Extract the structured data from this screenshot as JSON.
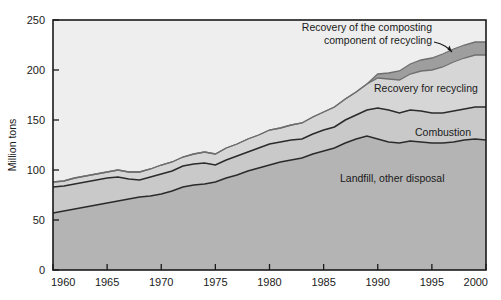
{
  "chart_data": {
    "type": "area",
    "title": "",
    "xlabel": "",
    "ylabel": "Million tons",
    "xlim": [
      1960,
      2000
    ],
    "ylim": [
      0,
      250
    ],
    "ytick_step": 50,
    "xtick_step": 5,
    "grid": false,
    "legend_position": "inline-annotations",
    "stacked": true,
    "x": [
      1960,
      1961,
      1962,
      1963,
      1964,
      1965,
      1966,
      1967,
      1968,
      1969,
      1970,
      1971,
      1972,
      1973,
      1974,
      1975,
      1976,
      1977,
      1978,
      1979,
      1980,
      1981,
      1982,
      1983,
      1984,
      1985,
      1986,
      1987,
      1988,
      1989,
      1990,
      1991,
      1992,
      1993,
      1994,
      1995,
      1996,
      1997,
      1998,
      1999,
      2000
    ],
    "xticklabels": [
      "1960",
      "1965",
      "1970",
      "1975",
      "1980",
      "1985",
      "1990",
      "1995",
      "2000"
    ],
    "yticklabels": [
      "0",
      "50",
      "100",
      "150",
      "200",
      "250"
    ],
    "series": [
      {
        "name": "Landfill, other disposal",
        "label_text": "Landfill, other disposal",
        "fill_color": "#b4b4b4",
        "line_color": "#2b2b2b",
        "values": [
          57,
          59,
          61,
          63,
          65,
          67,
          69,
          71,
          73,
          74,
          76,
          79,
          83,
          85,
          86,
          88,
          92,
          95,
          99,
          102,
          105,
          108,
          110,
          112,
          116,
          119,
          122,
          127,
          131,
          134,
          131,
          128,
          127,
          129,
          128,
          127,
          127,
          128,
          130,
          131,
          130
        ]
      },
      {
        "name": "Combustion",
        "label_text": "Combustion",
        "fill_color": "#c9c9c9",
        "line_color": "#2b2b2b",
        "cumulative_values": [
          83,
          84,
          86,
          88,
          90,
          92,
          93,
          91,
          90,
          93,
          96,
          99,
          104,
          106,
          107,
          105,
          110,
          114,
          118,
          122,
          126,
          128,
          130,
          131,
          136,
          140,
          143,
          150,
          155,
          160,
          162,
          160,
          157,
          160,
          159,
          157,
          157,
          159,
          161,
          163,
          163
        ]
      },
      {
        "name": "Recovery for recycling",
        "label_text": "Recovery for recycling",
        "fill_color": "#d6d6d6",
        "line_color": "#6e6e6e",
        "cumulative_values": [
          88,
          89,
          92,
          94,
          96,
          98,
          100,
          98,
          98,
          101,
          105,
          108,
          113,
          116,
          118,
          116,
          122,
          126,
          131,
          135,
          140,
          142,
          145,
          147,
          153,
          158,
          163,
          171,
          178,
          186,
          192,
          191,
          190,
          196,
          199,
          200,
          203,
          208,
          212,
          215,
          215
        ]
      },
      {
        "name": "Recovery of the composting component of recycling",
        "label_text": "Recovery of the composting component of recycling",
        "fill_color": "#9e9e9e",
        "line_color": "#6e6e6e",
        "cumulative_values": [
          88,
          89,
          92,
          94,
          96,
          98,
          100,
          98,
          98,
          101,
          105,
          108,
          113,
          116,
          118,
          116,
          122,
          126,
          131,
          135,
          140,
          142,
          145,
          147,
          153,
          158,
          163,
          171,
          178,
          186,
          196,
          197,
          199,
          206,
          210,
          212,
          216,
          221,
          225,
          228,
          228
        ]
      }
    ],
    "annotations": [
      {
        "name": "composting-annotation",
        "line1": "Recovery of the composting",
        "line2": "component of recycling"
      }
    ],
    "background_color": "#eeeeee",
    "plot_border_color": "#1a1a1a"
  },
  "labels": {
    "y_axis_title": "Million tons",
    "landfill": "Landfill, other disposal",
    "combustion": "Combustion",
    "recycling": "Recovery for recycling",
    "composting_line1": "Recovery of the composting",
    "composting_line2": "component of recycling"
  },
  "yticks": [
    "250",
    "200",
    "150",
    "100",
    "50",
    "0"
  ],
  "xticks": [
    "1960",
    "1965",
    "1970",
    "1975",
    "1980",
    "1985",
    "1990",
    "1995",
    "2000"
  ]
}
